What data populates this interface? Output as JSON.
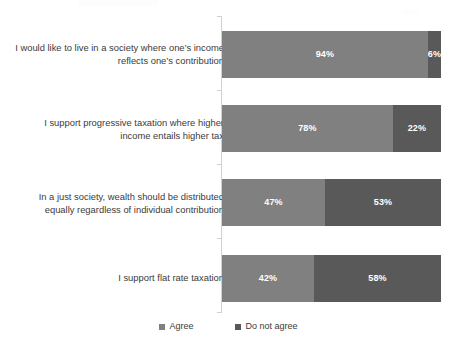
{
  "chart_data": {
    "type": "bar",
    "orientation": "horizontal",
    "stacked": true,
    "stack_total": 100,
    "title": "",
    "subtitle": "",
    "xlabel": "",
    "ylabel": "",
    "xlim": [
      0,
      100
    ],
    "grid": false,
    "legend_position": "bottom",
    "value_suffix": "%",
    "categories": [
      "I would like to live in a society where one’s income reflects one’s contribution",
      "I support progressive taxation where higher income entails higher tax",
      "In a just society, wealth should be distributed equally regardless of individual contribution",
      "I support flat rate taxation"
    ],
    "series": [
      {
        "name": "Agree",
        "color": "#808080",
        "values": [
          94,
          78,
          47,
          42
        ],
        "labels": [
          "94%",
          "78%",
          "47%",
          "42%"
        ]
      },
      {
        "name": "Do not agree",
        "color": "#595959",
        "values": [
          6,
          22,
          53,
          58
        ],
        "labels": [
          "6%",
          "22%",
          "53%",
          "58%"
        ]
      }
    ],
    "legend": [
      {
        "label": "Agree",
        "color": "#808080"
      },
      {
        "label": "Do not agree",
        "color": "#595959"
      }
    ]
  },
  "colors": {
    "agree": "#808080",
    "do_not_agree": "#595959",
    "axis": "#d0d0d0",
    "text": "#3b3b3b",
    "value_text": "#ffffff",
    "background": "#ffffff"
  }
}
